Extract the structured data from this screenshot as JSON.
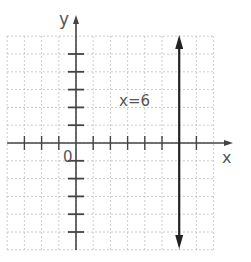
{
  "diagram": {
    "axes": {
      "x_label": "x",
      "y_label": "y",
      "origin_label": "0",
      "x_range": [
        -4,
        8
      ],
      "y_range": [
        -6,
        6
      ],
      "x_ticks": [
        -3,
        -2,
        -1,
        1,
        2,
        3,
        4,
        5,
        7
      ],
      "y_ticks": [
        5,
        4,
        3,
        2,
        1,
        -1,
        -2,
        -3,
        -4,
        -5
      ]
    },
    "grid": {
      "style": "dotted",
      "color": "#bbbbbb",
      "step": 1
    },
    "line": {
      "equation_label": "x=6",
      "x_value": 6,
      "color": "#222222",
      "arrows": "both"
    }
  }
}
